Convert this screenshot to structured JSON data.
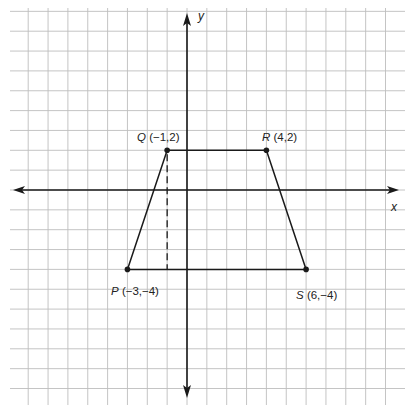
{
  "diagram": {
    "type": "coordinate-plane",
    "grid": {
      "unit_px": 19.85,
      "origin_px": [
        187,
        190
      ],
      "x_range": [
        -9,
        10
      ],
      "y_range": [
        -10,
        9
      ],
      "color": "#bdbdbd"
    },
    "axes": {
      "x_label": "x",
      "y_label": "y",
      "color": "#1a1a1a"
    },
    "shape": {
      "name": "trapezoid PQRS",
      "stroke": "#1a1a1a",
      "vertices": [
        {
          "name": "P",
          "coords": "(−3,−4)",
          "x": -3,
          "y": -4
        },
        {
          "name": "Q",
          "coords": "(−1,2)",
          "x": -1,
          "y": 2
        },
        {
          "name": "R",
          "coords": "(4,2)",
          "x": 4,
          "y": 2
        },
        {
          "name": "S",
          "coords": "(6,−4)",
          "x": 6,
          "y": -4
        }
      ]
    },
    "height_segment": {
      "style": "dashed",
      "from": {
        "x": -1,
        "y": 2
      },
      "to": {
        "x": -1,
        "y": -4
      }
    }
  }
}
